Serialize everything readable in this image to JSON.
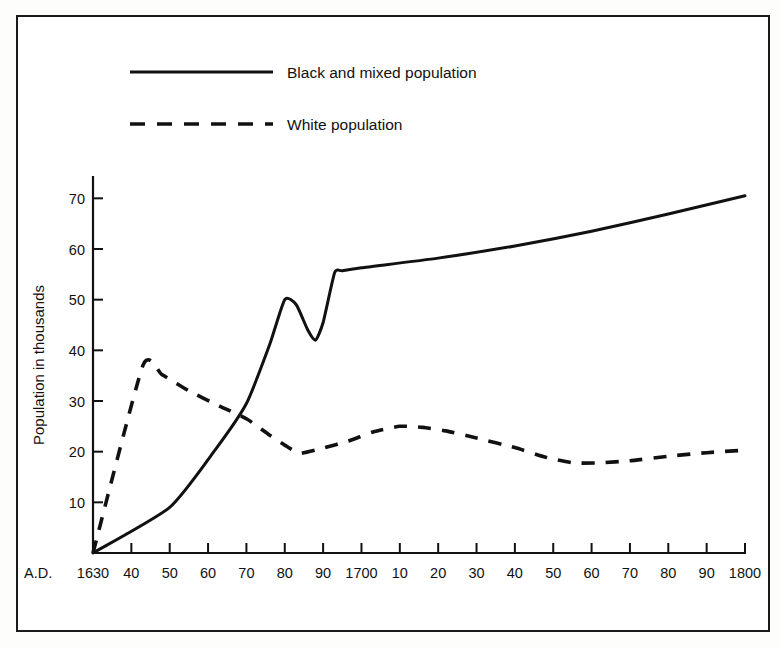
{
  "chart_data": {
    "type": "line",
    "title": "",
    "xlabel": "",
    "ylabel": "Population in thousands",
    "xlim": [
      1630,
      1800
    ],
    "ylim": [
      0,
      75
    ],
    "grid": false,
    "legend_position": "top-left",
    "x_axis_prefix": "A.D.",
    "x_tick_values": [
      1630,
      1640,
      1650,
      1660,
      1670,
      1680,
      1690,
      1700,
      1710,
      1720,
      1730,
      1740,
      1750,
      1760,
      1770,
      1780,
      1790,
      1800
    ],
    "x_tick_labels": [
      "1630",
      "40",
      "50",
      "60",
      "70",
      "80",
      "90",
      "1700",
      "10",
      "20",
      "30",
      "40",
      "50",
      "60",
      "70",
      "80",
      "90",
      "1800"
    ],
    "y_tick_values": [
      10,
      20,
      30,
      40,
      50,
      60,
      70
    ],
    "y_tick_labels": [
      "10",
      "20",
      "30",
      "40",
      "50",
      "60",
      "70"
    ],
    "series": [
      {
        "name": "Black and mixed population",
        "style": "solid",
        "color": "#111111",
        "x": [
          1630,
          1650,
          1662,
          1670,
          1676,
          1680,
          1683,
          1686,
          1688,
          1690,
          1693,
          1695,
          1700,
          1720,
          1740,
          1760,
          1780,
          1800
        ],
        "values": [
          0,
          9,
          20.5,
          29.5,
          41,
          50,
          49,
          44,
          42,
          45.5,
          55.3,
          55.7,
          56.3,
          58.2,
          60.6,
          63.5,
          66.9,
          70.5
        ]
      },
      {
        "name": "White population",
        "style": "dashed",
        "color": "#111111",
        "x": [
          1630,
          1643,
          1648,
          1655,
          1663,
          1670,
          1676,
          1680,
          1684,
          1690,
          1697,
          1703,
          1710,
          1716,
          1722,
          1730,
          1740,
          1748,
          1755,
          1762,
          1770,
          1780,
          1790,
          1800
        ],
        "values": [
          0,
          37,
          35.2,
          32,
          29,
          26.5,
          23.3,
          21.3,
          19.7,
          20.7,
          22.2,
          23.9,
          25,
          24.8,
          24.1,
          22.7,
          20.8,
          18.9,
          17.8,
          17.8,
          18.2,
          19.1,
          19.8,
          20.3
        ]
      }
    ]
  },
  "legend": {
    "items": [
      {
        "label": "Black and mixed population",
        "style": "solid"
      },
      {
        "label": "White population",
        "style": "dashed"
      }
    ]
  },
  "axes": {
    "y_title": "Population in thousands",
    "x_prefix": "A.D."
  }
}
